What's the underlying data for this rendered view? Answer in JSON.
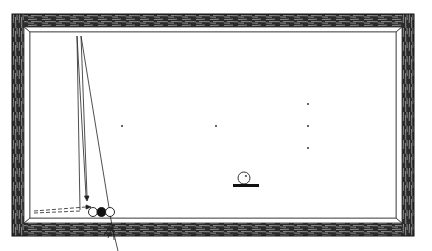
{
  "diagram": {
    "colors": {
      "background": "#ffffff",
      "ink": "#1a1a1a",
      "rail_wood": "#2b2b2b",
      "rail_highlight": "#9a9a9a",
      "cloth": "#ffffff"
    },
    "table": {
      "outer": {
        "x": 12,
        "y": 14,
        "w": 402,
        "h": 222
      },
      "inner": {
        "x": 30,
        "y": 32,
        "w": 370,
        "h": 186
      }
    },
    "spots": [
      {
        "x": 122,
        "y": 126
      },
      {
        "x": 216,
        "y": 126
      },
      {
        "x": 308,
        "y": 104
      },
      {
        "x": 308,
        "y": 126
      },
      {
        "x": 308,
        "y": 148
      }
    ],
    "balls": [
      {
        "name": "white-ball-left",
        "x": 93,
        "y": 212,
        "r": 4.5,
        "fill": "#ffffff"
      },
      {
        "name": "red-ball-black",
        "x": 101,
        "y": 212,
        "r": 4.5,
        "fill": "#111111"
      },
      {
        "name": "white-ball-right",
        "x": 110,
        "y": 212,
        "r": 4.5,
        "fill": "#ffffff"
      }
    ],
    "legend_symbol": {
      "ball_x": 244,
      "ball_y": 178,
      "ball_r": 6,
      "bar_x": 233,
      "bar_y": 184,
      "bar_w": 26,
      "bar_h": 3
    }
  }
}
